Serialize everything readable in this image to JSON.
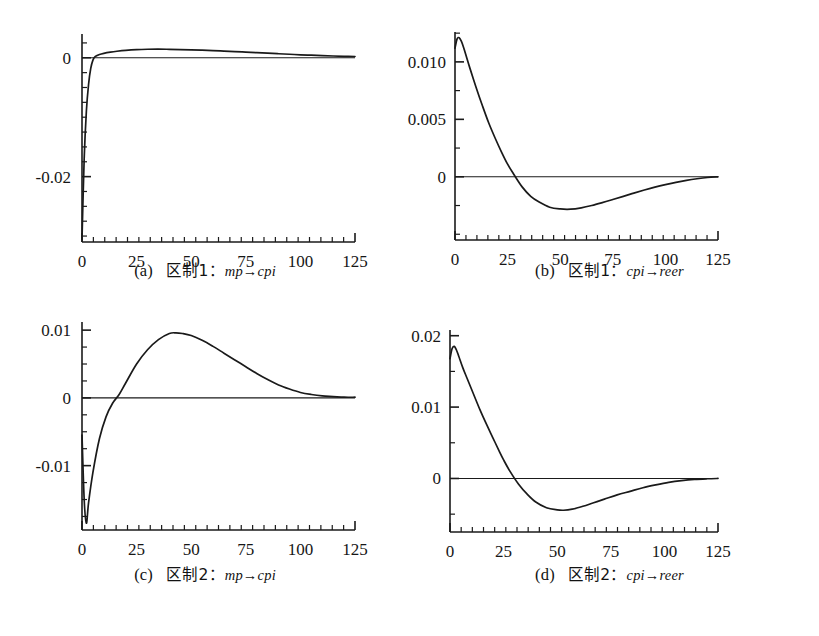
{
  "figure": {
    "background_color": "#ffffff",
    "line_color": "#1a1a1a",
    "panel_count": 4,
    "layout": "2x2"
  },
  "panels": [
    {
      "key": "a",
      "caption_index": "(a)",
      "caption_regime": "区制1：",
      "caption_relation": "mp→cpi",
      "caption_full": "(a) 区制1：mp→cpi"
    },
    {
      "key": "b",
      "caption_index": "(b)",
      "caption_regime": "区制1：",
      "caption_relation": "cpi→reer",
      "caption_full": "(b) 区制1：cpi→reer"
    },
    {
      "key": "c",
      "caption_index": "(c)",
      "caption_regime": "区制2：",
      "caption_relation": "mp→cpi",
      "caption_full": "(c) 区制2：mp→cpi"
    },
    {
      "key": "d",
      "caption_index": "(d)",
      "caption_regime": "区制2：",
      "caption_relation": "cpi→reer",
      "caption_full": "(d) 区制2：cpi→reer"
    }
  ],
  "chart_data": [
    {
      "id": "panel-a",
      "type": "line",
      "title": "(a) 区制1：mp→cpi",
      "xlabel": "",
      "ylabel": "",
      "xlim": [
        0,
        125
      ],
      "ylim": [
        -0.031,
        0.004
      ],
      "xticks": [
        0,
        25,
        50,
        75,
        100,
        125
      ],
      "xticklabels": [
        "0",
        "25",
        "50",
        "75",
        "100",
        "125"
      ],
      "yticks": [
        0,
        -0.02
      ],
      "yticklabels": [
        "0",
        "-0.02"
      ],
      "grid": false,
      "legend": false,
      "zero_line": true,
      "x": [
        0,
        1,
        2,
        3,
        4,
        5,
        6,
        8,
        10,
        13,
        16,
        20,
        25,
        30,
        35,
        40,
        45,
        50,
        55,
        60,
        65,
        70,
        75,
        80,
        85,
        90,
        95,
        100,
        105,
        110,
        115,
        120,
        125
      ],
      "y": [
        -0.0305,
        -0.017,
        -0.009,
        -0.0045,
        -0.0018,
        -0.0004,
        0.0002,
        0.00055,
        0.00075,
        0.00095,
        0.0011,
        0.00125,
        0.00137,
        0.00143,
        0.00145,
        0.00142,
        0.00138,
        0.00133,
        0.00127,
        0.0012,
        0.00112,
        0.00104,
        0.00095,
        0.00086,
        0.00077,
        0.00068,
        0.00059,
        0.0005,
        0.00043,
        0.00036,
        0.0003,
        0.00025,
        0.00021
      ]
    },
    {
      "id": "panel-b",
      "type": "line",
      "title": "(b) 区制1：cpi→reer",
      "xlabel": "",
      "ylabel": "",
      "xlim": [
        0,
        125
      ],
      "ylim": [
        -0.0055,
        0.0126
      ],
      "xticks": [
        0,
        25,
        50,
        75,
        100,
        125
      ],
      "xticklabels": [
        "0",
        "25",
        "50",
        "75",
        "100",
        "125"
      ],
      "yticks": [
        0.01,
        0.005,
        0
      ],
      "yticklabels": [
        "0.010",
        "0.005",
        "0"
      ],
      "grid": false,
      "legend": false,
      "zero_line": true,
      "x": [
        0,
        1,
        2,
        3,
        4,
        5,
        7,
        10,
        13,
        16,
        19,
        22,
        25,
        28,
        32,
        36,
        40,
        45,
        50,
        55,
        60,
        65,
        70,
        75,
        80,
        85,
        90,
        95,
        100,
        105,
        110,
        115,
        120,
        125
      ],
      "y": [
        0.0112,
        0.012,
        0.0121,
        0.0118,
        0.0113,
        0.0107,
        0.0095,
        0.0078,
        0.0062,
        0.0047,
        0.0034,
        0.0022,
        0.0011,
        0.0002,
        -0.0009,
        -0.0017,
        -0.0022,
        -0.00265,
        -0.0028,
        -0.00282,
        -0.0027,
        -0.0025,
        -0.00225,
        -0.00198,
        -0.0017,
        -0.00142,
        -0.00115,
        -0.0009,
        -0.00068,
        -0.00048,
        -0.00031,
        -0.00017,
        -6e-05,
        0.0
      ]
    },
    {
      "id": "panel-c",
      "type": "line",
      "title": "(c) 区制2：mp→cpi",
      "xlabel": "",
      "ylabel": "",
      "xlim": [
        0,
        125
      ],
      "ylim": [
        -0.0195,
        0.0112
      ],
      "xticks": [
        0,
        25,
        50,
        75,
        100,
        125
      ],
      "xticklabels": [
        "0",
        "25",
        "50",
        "75",
        "100",
        "125"
      ],
      "yticks": [
        0.01,
        0,
        -0.01
      ],
      "yticklabels": [
        "0.01",
        "0",
        "-0.01"
      ],
      "grid": false,
      "legend": false,
      "zero_line": true,
      "x": [
        0,
        1,
        2,
        3,
        5,
        8,
        11,
        14,
        17,
        20,
        25,
        30,
        35,
        40,
        43,
        46,
        50,
        55,
        60,
        65,
        70,
        75,
        80,
        85,
        90,
        95,
        100,
        105,
        110,
        115,
        120,
        125
      ],
      "y": [
        -0.0055,
        -0.015,
        -0.0185,
        -0.0155,
        -0.011,
        -0.006,
        -0.0028,
        -0.0008,
        0.0005,
        0.0022,
        0.005,
        0.0071,
        0.0086,
        0.0095,
        0.0096,
        0.0095,
        0.0092,
        0.0085,
        0.0076,
        0.0066,
        0.0056,
        0.0046,
        0.0036,
        0.0027,
        0.0019,
        0.0013,
        0.0008,
        0.0005,
        0.0003,
        0.0002,
        0.0001,
        0.0001
      ]
    },
    {
      "id": "panel-d",
      "type": "line",
      "title": "(d) 区制2：cpi→reer",
      "xlabel": "",
      "ylabel": "",
      "xlim": [
        0,
        125
      ],
      "ylim": [
        -0.0075,
        0.0208
      ],
      "xticks": [
        0,
        25,
        50,
        75,
        100,
        125
      ],
      "xticklabels": [
        "0",
        "25",
        "50",
        "75",
        "100",
        "125"
      ],
      "yticks": [
        0.02,
        0.01,
        0
      ],
      "yticklabels": [
        "0.02",
        "0.01",
        "0"
      ],
      "grid": false,
      "legend": false,
      "zero_line": true,
      "x": [
        0,
        1,
        2,
        3,
        4,
        6,
        8,
        11,
        14,
        17,
        20,
        23,
        25,
        28,
        32,
        36,
        40,
        45,
        50,
        53,
        57,
        62,
        67,
        72,
        78,
        84,
        90,
        96,
        102,
        108,
        114,
        120,
        125
      ],
      "y": [
        0.0168,
        0.0182,
        0.0185,
        0.018,
        0.0172,
        0.0155,
        0.014,
        0.0118,
        0.0096,
        0.0076,
        0.0057,
        0.0038,
        0.0026,
        0.001,
        -0.0008,
        -0.0022,
        -0.0033,
        -0.0041,
        -0.0044,
        -0.00445,
        -0.0043,
        -0.0039,
        -0.0034,
        -0.0029,
        -0.0023,
        -0.0018,
        -0.0013,
        -0.0009,
        -0.00055,
        -0.0003,
        -0.00013,
        -4e-05,
        0.0
      ]
    }
  ]
}
